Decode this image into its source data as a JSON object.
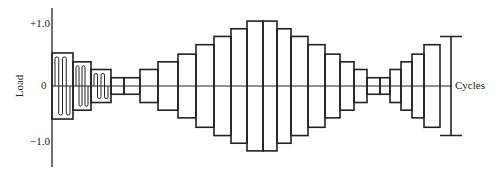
{
  "chart_data": {
    "type": "diagram",
    "title": "",
    "xlabel": "Cycles",
    "ylabel": "Load",
    "y_ticks": [
      "+1.0",
      "0",
      "-1.0"
    ],
    "ylim": [
      -1.0,
      1.0
    ],
    "blocks": [
      {
        "x0": 52,
        "x1": 73,
        "amp": 0.56,
        "wavy": true
      },
      {
        "x0": 73,
        "x1": 91,
        "amp": 0.41,
        "wavy": true
      },
      {
        "x0": 91,
        "x1": 111,
        "amp": 0.28,
        "wavy": true
      },
      {
        "x0": 111,
        "x1": 124,
        "amp": 0.14
      },
      {
        "x0": 124,
        "x1": 140,
        "amp": 0.14
      },
      {
        "x0": 140,
        "x1": 158,
        "amp": 0.28
      },
      {
        "x0": 158,
        "x1": 178,
        "amp": 0.41
      },
      {
        "x0": 178,
        "x1": 196,
        "amp": 0.54
      },
      {
        "x0": 196,
        "x1": 214,
        "amp": 0.7
      },
      {
        "x0": 214,
        "x1": 231,
        "amp": 0.84
      },
      {
        "x0": 231,
        "x1": 247,
        "amp": 0.97
      },
      {
        "x0": 247,
        "x1": 263,
        "amp": 1.1
      },
      {
        "x0": 263,
        "x1": 277,
        "amp": 1.1
      },
      {
        "x0": 277,
        "x1": 291,
        "amp": 0.97
      },
      {
        "x0": 291,
        "x1": 308,
        "amp": 0.84
      },
      {
        "x0": 308,
        "x1": 325,
        "amp": 0.7
      },
      {
        "x0": 325,
        "x1": 340,
        "amp": 0.54
      },
      {
        "x0": 340,
        "x1": 354,
        "amp": 0.41
      },
      {
        "x0": 354,
        "x1": 367,
        "amp": 0.28
      },
      {
        "x0": 367,
        "x1": 380,
        "amp": 0.14
      },
      {
        "x0": 380,
        "x1": 390,
        "amp": 0.14
      },
      {
        "x0": 390,
        "x1": 401,
        "amp": 0.28
      },
      {
        "x0": 401,
        "x1": 412,
        "amp": 0.41
      },
      {
        "x0": 412,
        "x1": 424,
        "amp": 0.54
      },
      {
        "x0": 424,
        "x1": 440,
        "amp": 0.7
      },
      {
        "x0": 440,
        "x1": 451,
        "amp": 0.84,
        "open_right": true
      }
    ]
  },
  "labels": {
    "y_top": "+1.0",
    "y_zero": "0",
    "y_bottom": "−1.0",
    "ylabel": "Load",
    "xlabel": "Cycles"
  }
}
